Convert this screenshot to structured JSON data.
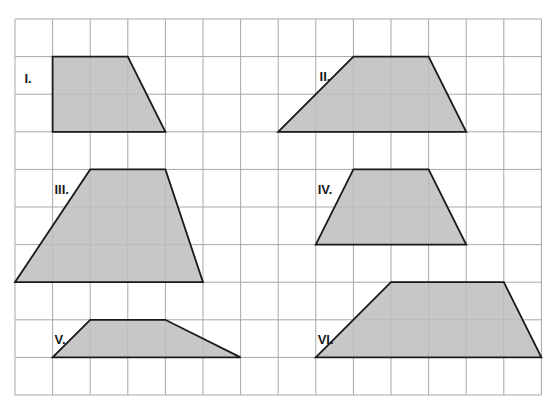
{
  "grid": {
    "origin_x": 15,
    "origin_y": 19,
    "cell": 37.6,
    "cols": 14,
    "rows": 10,
    "line_color": "#a8a8a8",
    "background": "#ffffff"
  },
  "style": {
    "fill": "#bdbdbd",
    "stroke": "#1a1a1a"
  },
  "shapes": [
    {
      "id": "I",
      "label": "I.",
      "points": [
        [
          1,
          1
        ],
        [
          3,
          1
        ],
        [
          4,
          3
        ],
        [
          1,
          3
        ]
      ],
      "label_pos": [
        0.25,
        1.6
      ]
    },
    {
      "id": "II",
      "label": "II.",
      "points": [
        [
          9,
          1
        ],
        [
          11,
          1
        ],
        [
          12,
          3
        ],
        [
          7,
          3
        ]
      ],
      "label_pos": [
        8.1,
        1.55
      ]
    },
    {
      "id": "III",
      "label": "III.",
      "points": [
        [
          2,
          4
        ],
        [
          4,
          4
        ],
        [
          5,
          7
        ],
        [
          0,
          7
        ]
      ],
      "label_pos": [
        1.05,
        4.55
      ]
    },
    {
      "id": "IV",
      "label": "IV.",
      "points": [
        [
          9,
          4
        ],
        [
          11,
          4
        ],
        [
          12,
          6
        ],
        [
          8,
          6
        ]
      ],
      "label_pos": [
        8.05,
        4.55
      ]
    },
    {
      "id": "V",
      "label": "V.",
      "points": [
        [
          2,
          8
        ],
        [
          4,
          8
        ],
        [
          6,
          9
        ],
        [
          1,
          9
        ]
      ],
      "label_pos": [
        1.05,
        8.55
      ]
    },
    {
      "id": "VI",
      "label": "VI.",
      "points": [
        [
          10,
          7
        ],
        [
          13,
          7
        ],
        [
          14,
          9
        ],
        [
          8,
          9
        ]
      ],
      "label_pos": [
        8.05,
        8.55
      ]
    }
  ]
}
